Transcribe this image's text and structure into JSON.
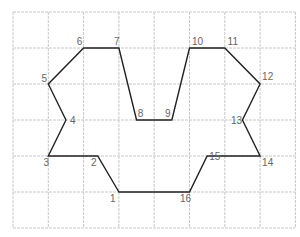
{
  "diagram": {
    "title": "",
    "grid": {
      "columns": 8,
      "rows": 6,
      "line_color": "#c8c8c8"
    },
    "outline_color": "#222222",
    "label_color": "#666666",
    "vertices": [
      {
        "label": "1",
        "x": 3.0,
        "y": 5.0
      },
      {
        "label": "2",
        "x": 2.4,
        "y": 4.0
      },
      {
        "label": "3",
        "x": 1.0,
        "y": 4.0
      },
      {
        "label": "4",
        "x": 1.5,
        "y": 3.0
      },
      {
        "label": "5",
        "x": 1.0,
        "y": 2.0
      },
      {
        "label": "6",
        "x": 2.0,
        "y": 1.0
      },
      {
        "label": "7",
        "x": 3.0,
        "y": 1.0
      },
      {
        "label": "8",
        "x": 3.5,
        "y": 3.0
      },
      {
        "label": "9",
        "x": 4.5,
        "y": 3.0
      },
      {
        "label": "10",
        "x": 5.0,
        "y": 1.0
      },
      {
        "label": "11",
        "x": 6.0,
        "y": 1.0
      },
      {
        "label": "12",
        "x": 7.0,
        "y": 2.0
      },
      {
        "label": "13",
        "x": 6.5,
        "y": 3.0
      },
      {
        "label": "14",
        "x": 7.0,
        "y": 4.0
      },
      {
        "label": "15",
        "x": 5.5,
        "y": 4.0
      },
      {
        "label": "16",
        "x": 5.0,
        "y": 5.0
      }
    ]
  }
}
